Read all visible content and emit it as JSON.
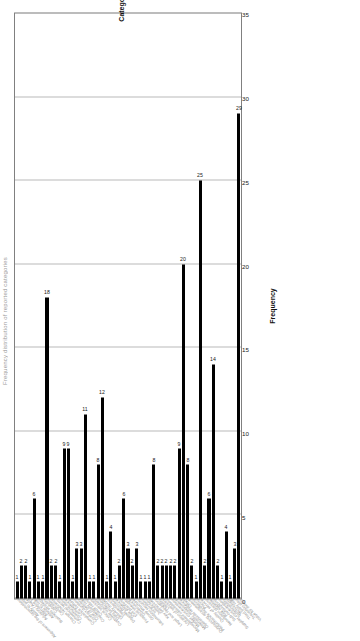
{
  "chart_data": {
    "type": "bar",
    "title": "Frequency distribution of reported categories",
    "xlabel": "Category",
    "ylabel": "Frequency",
    "orientation": "vertical-rotated",
    "ylim": [
      0,
      35
    ],
    "yticks": [
      "0",
      "5",
      "10",
      "15",
      "20",
      "25",
      "30",
      "35"
    ],
    "grid": true,
    "legend": "none",
    "bar_color": "#000000",
    "grid_color": "#b9b9b9",
    "axis_color": "#808080",
    "categories": [
      "Alignment of the organisation",
      "Ability to pay",
      "Advisory / Audit",
      "Alternative 1",
      "Attitude to risk",
      "Business strategy",
      "Capability",
      "Certification",
      "Change readiness",
      "Commercial terms",
      "Communication",
      "Competence",
      "Compliance culture",
      "Contract duration",
      "Cost of delivery",
      "Counterparty risk",
      "Credit rating",
      "Critical services",
      "Customer outcomes",
      "Data protection",
      "Delivery model",
      "Dependency",
      "Disaster recovery",
      "Due diligence",
      "Exit planning",
      "Financial strength",
      "Governance",
      "Group structure",
      "Information security",
      "Innovation",
      "Jurisdiction",
      "Key personnel",
      "Legal and regulatory",
      "Liability",
      "Location of services",
      "Management information",
      "Market concentration",
      "Materiality assessment",
      "Operational resilience",
      "Other",
      "Outsourcing arrangement",
      "Performance monitoring",
      "Pricing",
      "Quality of service",
      "Resolution planning",
      "Risk appetite",
      "Sub-outsourcing",
      "Supplier concentration",
      "Sustainability",
      "Technology",
      "Third party risk",
      "Transition plan",
      "Value for money"
    ],
    "values": [
      1,
      2,
      2,
      1,
      6,
      1,
      1,
      18,
      2,
      2,
      1,
      9,
      9,
      1,
      3,
      3,
      11,
      1,
      1,
      8,
      12,
      1,
      4,
      1,
      2,
      6,
      3,
      2,
      3,
      1,
      1,
      1,
      8,
      2,
      2,
      2,
      2,
      2,
      9,
      20,
      8,
      2,
      1,
      25,
      2,
      6,
      14,
      2,
      1,
      4,
      1,
      3,
      29
    ]
  }
}
